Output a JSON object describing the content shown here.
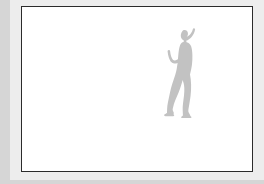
{
  "image": {
    "kind": "framed-picture-thumbnail",
    "alt_text": "Grey silhouette of a standing woman",
    "frame": {
      "border_color": "#2b2b2b",
      "border_width_px": 1.5,
      "fill_color": "#ffffff",
      "x": 21,
      "y": 6,
      "width": 232,
      "height": 166
    },
    "background": {
      "outer_color": "#d9d9d9",
      "paper_color": "#ededed"
    },
    "subject": {
      "name": "woman-silhouette",
      "description": "Standing woman in profile, right arm raised with hand to head, left hand resting on hip, wearing flared bell-bottom trousers",
      "fill_color": "#c2c2c2",
      "x": 163,
      "y": 27,
      "width": 38,
      "height": 90
    }
  }
}
